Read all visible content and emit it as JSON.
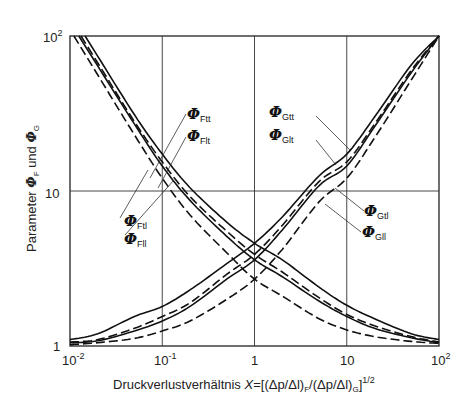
{
  "chart_data": {
    "type": "line",
    "title": "",
    "xlabel": "Druckverlustverhältnis X = [(Δp/Δl)_F / (Δp/Δl)_G]^1/2",
    "ylabel": "Parameter Φ_F und Φ_G",
    "xscale": "log",
    "yscale": "log",
    "xlim": [
      0.01,
      100
    ],
    "ylim": [
      1,
      100
    ],
    "grid": true,
    "x_ticks": [
      "10^-2",
      "10^-1",
      "1",
      "10",
      "10^2"
    ],
    "y_ticks": [
      "1",
      "10",
      "10^2"
    ],
    "x": [
      0.01,
      0.02,
      0.05,
      0.1,
      0.2,
      0.5,
      1,
      2,
      5,
      10,
      20,
      50,
      100
    ],
    "series": [
      {
        "name": "Φ_Ftt",
        "style": "solid",
        "values": [
          null,
          74,
          31,
          17.3,
          10.5,
          6.3,
          4.6,
          3.6,
          2.4,
          1.83,
          1.5,
          1.2,
          1.1
        ]
      },
      {
        "name": "Φ_Flt",
        "style": "dashed",
        "values": [
          null,
          67,
          28,
          15.4,
          9.2,
          5.5,
          3.9,
          3.0,
          2.05,
          1.6,
          1.35,
          1.15,
          1.06
        ]
      },
      {
        "name": "Φ_Ftl",
        "style": "solid",
        "values": [
          null,
          64,
          27,
          14.5,
          8.7,
          5.1,
          3.6,
          2.8,
          1.95,
          1.55,
          1.3,
          1.13,
          1.05
        ]
      },
      {
        "name": "Φ_Fll",
        "style": "dashed",
        "values": [
          null,
          56,
          23,
          12.1,
          7.0,
          4.0,
          2.7,
          2.1,
          1.5,
          1.27,
          1.15,
          1.07,
          1.04
        ]
      },
      {
        "name": "Φ_Gtt",
        "style": "solid",
        "values": [
          1.1,
          1.2,
          1.55,
          1.8,
          2.3,
          3.4,
          4.6,
          6.8,
          12.5,
          17.3,
          30,
          65,
          100
        ]
      },
      {
        "name": "Φ_Glt",
        "style": "dashed",
        "values": [
          1.06,
          1.1,
          1.3,
          1.55,
          1.9,
          2.9,
          3.9,
          6.0,
          11.5,
          15.4,
          27,
          60,
          100
        ]
      },
      {
        "name": "Φ_Gtl",
        "style": "solid",
        "values": [
          1.05,
          1.08,
          1.25,
          1.45,
          1.8,
          2.7,
          3.6,
          5.6,
          10.8,
          14.5,
          26,
          58,
          100
        ]
      },
      {
        "name": "Φ_Gll",
        "style": "dashed",
        "values": [
          1.02,
          1.05,
          1.12,
          1.25,
          1.45,
          2.0,
          2.7,
          4.2,
          8.5,
          12.1,
          22,
          52,
          100
        ]
      }
    ],
    "annotations": [
      "Φ_Ftt",
      "Φ_Flt",
      "Φ_Ftl",
      "Φ_Fll",
      "Φ_Gtt",
      "Φ_Glt",
      "Φ_Gtl",
      "Φ_Gll"
    ]
  },
  "axes": {
    "x_title_prefix": "Druckverlustverhältnis ",
    "x_title_var": "X",
    "x_title_formula": "=[(Δp/Δl)",
    "x_title_sub1": "F",
    "x_title_mid": "/(Δp/Δl)",
    "x_title_sub2": "G",
    "x_title_end": "]",
    "x_title_exp": "1/2",
    "y_title_prefix": "Parameter ",
    "y_title_phi1": "Φ",
    "y_title_sub1": "F",
    "y_title_mid": " und ",
    "y_title_phi2": "Φ",
    "y_title_sub2": "G",
    "x_ticks": [
      {
        "base": "10",
        "exp": "-2"
      },
      {
        "base": "10",
        "exp": "-1"
      },
      {
        "base": "1",
        "exp": ""
      },
      {
        "base": "10",
        "exp": ""
      },
      {
        "base": "10",
        "exp": "2"
      }
    ],
    "y_ticks": [
      {
        "base": "1",
        "exp": ""
      },
      {
        "base": "10",
        "exp": ""
      },
      {
        "base": "10",
        "exp": "2"
      }
    ]
  },
  "labels": {
    "phi": "Φ",
    "Ftt": "Ftt",
    "Flt": "Flt",
    "Ftl": "Ftl",
    "Fll": "Fll",
    "Gtt": "Gtt",
    "Glt": "Glt",
    "Gtl": "Gtl",
    "Gll": "Gll"
  }
}
